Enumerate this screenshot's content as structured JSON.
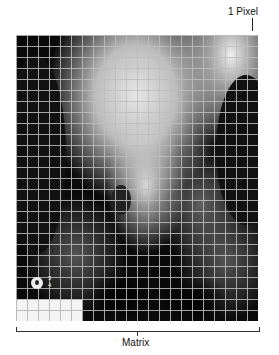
{
  "figure": {
    "annotations": {
      "pixel_label": "1 Pixel",
      "matrix_label": "Matrix",
      "marker_top": "3",
      "marker_bottom": "4"
    },
    "grid": {
      "columns": 22,
      "rows": 26,
      "cell_px": 11,
      "line_color": "#bebebe"
    },
    "colors": {
      "background": "#ffffff",
      "image_dark": "#0a0a0a",
      "bone_light": "#e6e6e6",
      "text": "#111111"
    }
  }
}
